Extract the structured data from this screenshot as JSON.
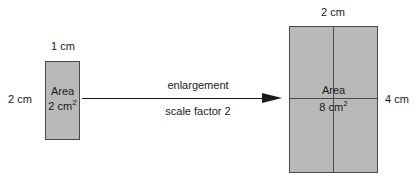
{
  "diagram": {
    "background_color": "#ffffff",
    "shape_fill_color": "#b9b9b9",
    "shape_stroke_color": "#4a4a4a",
    "text_color": "#1a1a1a"
  },
  "small_shape": {
    "top_label": "1 cm",
    "left_label": "2 cm",
    "area_label": "Area",
    "area_value": "2 cm",
    "area_exponent": "2"
  },
  "transform": {
    "label_top": "enlargement",
    "label_bottom": "scale factor 2",
    "arrow_icon": "right-arrow-icon"
  },
  "large_shape": {
    "top_label": "2 cm",
    "right_label": "4 cm",
    "area_label": "Area",
    "area_value": "8 cm",
    "area_exponent": "2"
  }
}
